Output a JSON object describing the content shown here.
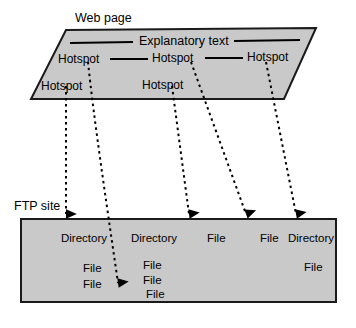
{
  "diagram": {
    "title_webpage": "Web page",
    "title_ftp": "FTP site",
    "explanatory_text": "Explanatory text",
    "webpage_panel": {
      "name": "web-page-parallelogram",
      "fill": "#c9c9c9",
      "stroke": "#000000",
      "hotspots_row1": [
        "Hotspot",
        "Hotspot",
        "Hotspot"
      ],
      "hotspots_row2": [
        "Hotspot",
        "Hotspot"
      ]
    },
    "ftp_panel": {
      "name": "ftp-site-rectangle",
      "fill": "#c9c9c9",
      "stroke": "#000000",
      "entries": [
        {
          "label": "Directory",
          "x": 61,
          "y": 239
        },
        {
          "label": "File",
          "x": 83,
          "y": 269
        },
        {
          "label": "File",
          "x": 83,
          "y": 285
        },
        {
          "label": "Directory",
          "x": 131,
          "y": 239
        },
        {
          "label": "File",
          "x": 143,
          "y": 266
        },
        {
          "label": "File",
          "x": 143,
          "y": 281
        },
        {
          "label": "File",
          "x": 146,
          "y": 295
        },
        {
          "label": "File",
          "x": 207,
          "y": 239
        },
        {
          "label": "File",
          "x": 260,
          "y": 239
        },
        {
          "label": "Directory",
          "x": 296,
          "y": 239
        },
        {
          "label": "File",
          "x": 311,
          "y": 268
        }
      ]
    },
    "connectors": [
      {
        "name": "connector-hotspot-1",
        "from": "hotspot-lower-left",
        "to": "directory-1"
      },
      {
        "name": "connector-hotspot-2",
        "from": "hotspot-upper-left",
        "to": "file-3-under-directory-2"
      },
      {
        "name": "connector-hotspot-3",
        "from": "hotspot-lower-middle",
        "to": "file-1"
      },
      {
        "name": "connector-hotspot-4",
        "from": "hotspot-upper-middle",
        "to": "file-2"
      },
      {
        "name": "connector-hotspot-5",
        "from": "hotspot-upper-right",
        "to": "directory-3"
      }
    ],
    "colors": {
      "panel_fill": "#c9c9c9",
      "outline": "#000000",
      "background": "#ffffff"
    }
  }
}
